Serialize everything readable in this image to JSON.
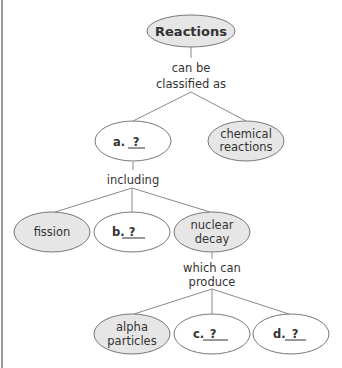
{
  "diagram": {
    "type": "concept-map",
    "colors": {
      "filled": "#e6e6e6",
      "empty": "#ffffff",
      "stroke": "#777777",
      "line": "#8a8a8a",
      "text": "#333333"
    },
    "root": {
      "label": "Reactions",
      "filled": true
    },
    "link_root": [
      "can be",
      "classified as"
    ],
    "node_a": {
      "prefix": "a.",
      "answer": "?",
      "filled": false
    },
    "node_chem": {
      "lines": [
        "chemical",
        "reactions"
      ],
      "filled": true
    },
    "link_a": [
      "including"
    ],
    "node_fission": {
      "label": "fission",
      "filled": true
    },
    "node_b": {
      "prefix": "b.",
      "answer": "?",
      "filled": false
    },
    "node_decay": {
      "lines": [
        "nuclear",
        "decay"
      ],
      "filled": true
    },
    "link_decay": [
      "which can",
      "produce"
    ],
    "node_alpha": {
      "lines": [
        "alpha",
        "particles"
      ],
      "filled": true
    },
    "node_c": {
      "prefix": "c.",
      "answer": "?",
      "filled": false
    },
    "node_d": {
      "prefix": "d.",
      "answer": "?",
      "filled": false
    }
  }
}
